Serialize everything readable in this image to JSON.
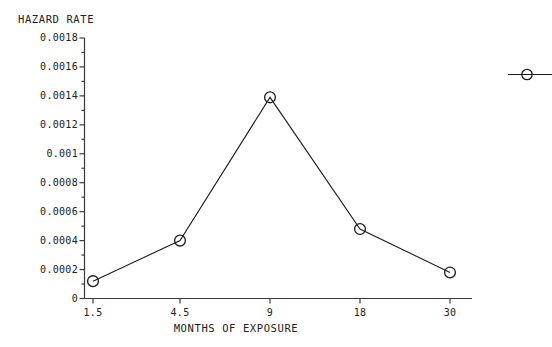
{
  "chart_data": {
    "type": "line",
    "title": "HAZARD RATE",
    "xlabel": "MONTHS OF EXPOSURE",
    "ylabel": "HAZARD RATE",
    "categories": [
      "1.5",
      "4.5",
      "9",
      "18",
      "30"
    ],
    "values": [
      0.00012,
      0.0004,
      0.00139,
      0.00048,
      0.00018
    ],
    "series": [
      {
        "name": "hazard rate",
        "values": [
          0.00012,
          0.0004,
          0.00139,
          0.00048,
          0.00018
        ],
        "marker": "open-circle",
        "line_color": "#1c1c1c"
      }
    ],
    "ylim": [
      0,
      0.0018
    ],
    "y_ticks": [
      "0",
      "0.0002",
      "0.0004",
      "0.0006",
      "0.0008",
      "0.001",
      "0.0012",
      "0.0014",
      "0.0016",
      "0.0018"
    ],
    "y_tick_values": [
      0,
      0.0002,
      0.0004,
      0.0006,
      0.0008,
      0.001,
      0.0012,
      0.0014,
      0.0016,
      0.0018
    ],
    "y_minor_ticks": true,
    "x_ticks": [
      "1.5",
      "4.5",
      "9",
      "18",
      "30"
    ],
    "grid": false,
    "legend": {
      "position": "right",
      "clipped": true,
      "entries": [
        {
          "label": "",
          "marker": "open-circle",
          "line_color": "#1c1c1c"
        }
      ]
    }
  },
  "colors": {
    "background": "#ffffff",
    "ink": "#1c1c1c",
    "axis": "#3a3a3a"
  }
}
